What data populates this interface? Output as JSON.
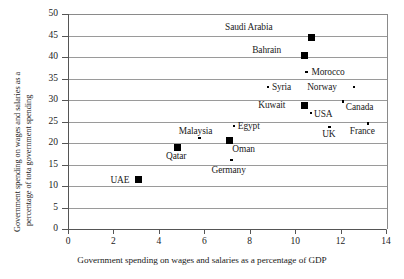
{
  "chart_data": {
    "type": "scatter",
    "title": "",
    "xlabel": "Government spending on wages and salaries as a percentage of GDP",
    "ylabel_line1": "Government spending on wages and salaries as a",
    "ylabel_line2": "percentage of tota government spending",
    "xlim": [
      0,
      14
    ],
    "ylim": [
      0,
      50
    ],
    "xticks": [
      0,
      2,
      4,
      6,
      8,
      10,
      12,
      14
    ],
    "yticks": [
      0,
      5,
      10,
      15,
      20,
      25,
      30,
      35,
      40,
      45,
      50
    ],
    "grid": "horizontal",
    "legend": "none",
    "points": [
      {
        "label": "Saudi Arabia",
        "x": 10.7,
        "y": 44.5,
        "marker": "square",
        "label_dx": -86,
        "label_dy": -16
      },
      {
        "label": "Bahrain",
        "x": 10.4,
        "y": 40.3,
        "marker": "square",
        "label_dx": -52,
        "label_dy": -11
      },
      {
        "label": "Morocco",
        "x": 10.5,
        "y": 36.5,
        "marker": "dot",
        "label_dx": 5,
        "label_dy": -5
      },
      {
        "label": "Syria",
        "x": 8.8,
        "y": 33.0,
        "marker": "dot",
        "label_dx": 4,
        "label_dy": -5
      },
      {
        "label": "Norway",
        "x": 12.6,
        "y": 33.0,
        "marker": "dot",
        "label_dx": -47,
        "label_dy": -5
      },
      {
        "label": "Kuwait",
        "x": 10.4,
        "y": 28.8,
        "marker": "square",
        "label_dx": -46,
        "label_dy": -5
      },
      {
        "label": "USA",
        "x": 10.7,
        "y": 27.0,
        "marker": "dot",
        "label_dx": 3,
        "label_dy": -4
      },
      {
        "label": "Canada",
        "x": 12.1,
        "y": 29.7,
        "marker": "dot",
        "label_dx": 3,
        "label_dy": 1
      },
      {
        "label": "Egypt",
        "x": 7.3,
        "y": 24.0,
        "marker": "dot",
        "label_dx": 4,
        "label_dy": -5
      },
      {
        "label": "UK",
        "x": 11.5,
        "y": 23.7,
        "marker": "dot",
        "label_dx": -7,
        "label_dy": 2
      },
      {
        "label": "France",
        "x": 13.2,
        "y": 24.5,
        "marker": "dot",
        "label_dx": -18,
        "label_dy": 2
      },
      {
        "label": "Malaysia",
        "x": 5.8,
        "y": 21.2,
        "marker": "dot",
        "label_dx": -21,
        "label_dy": -12
      },
      {
        "label": "Oman",
        "x": 7.1,
        "y": 20.5,
        "marker": "square",
        "label_dx": 3,
        "label_dy": 3
      },
      {
        "label": "Qatar",
        "x": 4.8,
        "y": 19.0,
        "marker": "square",
        "label_dx": -11,
        "label_dy": 4
      },
      {
        "label": "Germany",
        "x": 7.2,
        "y": 16.0,
        "marker": "dot",
        "label_dx": -20,
        "label_dy": 5
      },
      {
        "label": "UAE",
        "x": 3.1,
        "y": 11.5,
        "marker": "square",
        "label_dx": -28,
        "label_dy": -5
      }
    ]
  },
  "top_title_fragment": ""
}
